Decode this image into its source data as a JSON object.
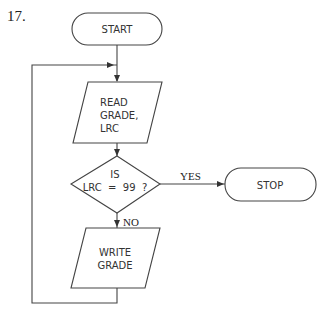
{
  "problem_number": "17.",
  "flowchart": {
    "start": {
      "label": "START"
    },
    "read": {
      "lines": [
        "READ",
        "GRADE,",
        "LRC"
      ]
    },
    "decision": {
      "lines": [
        "IS",
        "LRC  =  99  ?"
      ]
    },
    "yes_label": "YES",
    "no_label": "NO",
    "stop": {
      "label": "STOP"
    },
    "write": {
      "lines": [
        "WRITE",
        "GRADE"
      ]
    }
  }
}
